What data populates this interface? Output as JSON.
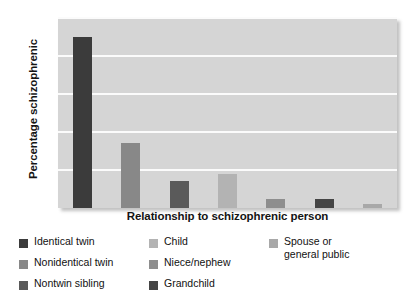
{
  "chart_data": {
    "type": "bar",
    "title": "",
    "subtitle": "",
    "xlabel": "Relationship to schizophrenic person",
    "ylabel": "Percentage schizophrenic",
    "ylim": [
      0,
      50
    ],
    "yticks": [
      10,
      20,
      30,
      40,
      50
    ],
    "ytick_labels": [
      "10",
      "20",
      "30",
      "40",
      "50"
    ],
    "grid": "horizontal",
    "legend_position": "below",
    "categories": [
      "Identical twin",
      "Nonidentical twin",
      "Nontwin sibling",
      "Child",
      "Niece/nephew",
      "Grandchild",
      "Spouse or general public"
    ],
    "values": [
      45,
      17,
      7,
      9,
      2.5,
      2.5,
      1
    ],
    "colors": [
      "#3b3b3b",
      "#888888",
      "#5a5a5a",
      "#b3b3b3",
      "#8e8e8e",
      "#454545",
      "#a8a8a8"
    ],
    "plot_background": "#d5d5d5",
    "gridline_color": "#fbfbfb"
  },
  "legend": {
    "columns": [
      {
        "items": [
          {
            "label": "Identical twin",
            "color": "#3b3b3b"
          },
          {
            "label": "Nonidentical twin",
            "color": "#888888"
          },
          {
            "label": "Nontwin sibling",
            "color": "#5a5a5a"
          }
        ]
      },
      {
        "items": [
          {
            "label": "Child",
            "color": "#b3b3b3"
          },
          {
            "label": "Niece/nephew",
            "color": "#8e8e8e"
          },
          {
            "label": "Grandchild",
            "color": "#454545"
          }
        ]
      },
      {
        "items": [
          {
            "label": "Spouse or\ngeneral public",
            "color": "#a8a8a8"
          }
        ]
      }
    ]
  }
}
